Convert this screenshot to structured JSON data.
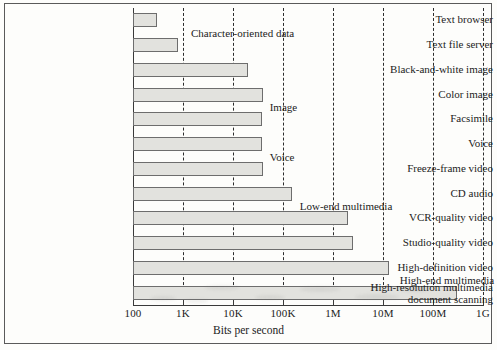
{
  "chart_data": {
    "type": "bar",
    "orientation": "horizontal",
    "title": "",
    "xlabel": "Bits per second",
    "ylabel": "",
    "xscale": "log",
    "xlim": [
      100,
      1000000000
    ],
    "grid": "vertical-dashed",
    "legend": "none",
    "xticks": [
      {
        "label": "100",
        "value": 100
      },
      {
        "label": "1K",
        "value": 1000
      },
      {
        "label": "10K",
        "value": 10000
      },
      {
        "label": "100K",
        "value": 100000
      },
      {
        "label": "1M",
        "value": 1000000
      },
      {
        "label": "10M",
        "value": 10000000
      },
      {
        "label": "100M",
        "value": 100000000
      },
      {
        "label": "1G",
        "value": 1000000000
      }
    ],
    "categories": [
      "Text browser",
      "Text file server",
      "Black-and-white image",
      "Color image",
      "Facsimile",
      "Voice",
      "Freeze-frame video",
      "CD audio",
      "VCR-quality video",
      "Studio-quality video",
      "High-definition video",
      "High-resolution multimedia document scanning"
    ],
    "values": [
      300,
      800,
      20000,
      40000,
      38000,
      38000,
      40000,
      150000,
      2000000,
      2500000,
      13000000,
      300000000
    ],
    "annotations": [
      {
        "text": "Character-oriented data",
        "value": 1200,
        "category_index": 0
      },
      {
        "text": "Image",
        "value": 45000,
        "category_index": 3
      },
      {
        "text": "Voice",
        "value": 45000,
        "category_index": 5
      },
      {
        "text": "Low-end multimedia",
        "value": 180000,
        "category_index": 7
      },
      {
        "text": "High-end multimedia",
        "value": 18000000,
        "category_index": 10
      }
    ]
  },
  "colors": {
    "bar_fill": "#e2e2de",
    "bar_stroke": "#6d6d6d",
    "grid": "#2d2d2d",
    "axis": "#3a3a3a",
    "text": "#1c1c1c",
    "background": "#fdfdfb"
  }
}
